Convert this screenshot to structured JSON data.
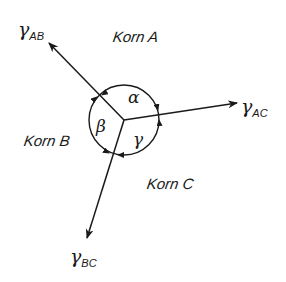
{
  "diagram": {
    "type": "grain-boundary-triple-junction",
    "grains": [
      {
        "id": "A",
        "label": "Korn A"
      },
      {
        "id": "B",
        "label": "Korn B"
      },
      {
        "id": "C",
        "label": "Korn C"
      }
    ],
    "tensions": [
      {
        "id": "AB",
        "symbol": "γ",
        "subscript": "AB"
      },
      {
        "id": "AC",
        "symbol": "γ",
        "subscript": "AC"
      },
      {
        "id": "BC",
        "symbol": "γ",
        "subscript": "BC"
      }
    ],
    "angles": [
      {
        "id": "alpha",
        "symbol": "α",
        "between": "AB-AC"
      },
      {
        "id": "beta",
        "symbol": "β",
        "between": "AB-BC"
      },
      {
        "id": "gamma",
        "symbol": "γ",
        "between": "AC-BC"
      }
    ],
    "colors": {
      "stroke": "#1a1a1a",
      "background": "#ffffff"
    }
  }
}
